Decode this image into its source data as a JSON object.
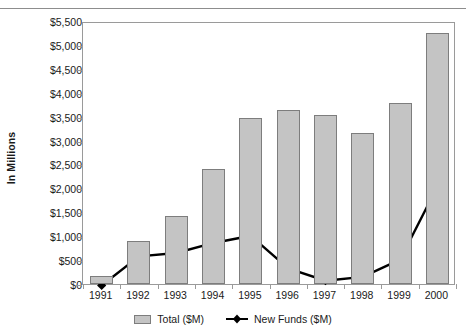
{
  "chart_data": {
    "type": "bar",
    "title": "",
    "xlabel": "",
    "ylabel": "In Millions",
    "ylim": [
      0,
      5500
    ],
    "ytick_step": 500,
    "grid": false,
    "legend_position": "bottom",
    "categories": [
      "1991",
      "1992",
      "1993",
      "1994",
      "1995",
      "1996",
      "1997",
      "1998",
      "1999",
      "2000"
    ],
    "ytick_labels": [
      "$5,500",
      "$5,000",
      "$4,500",
      "$4,000",
      "$3,500",
      "$3,000",
      "$2,500",
      "$2,000",
      "$1,500",
      "$1,000",
      "$500",
      "$0"
    ],
    "ytick_values": [
      5500,
      5000,
      4500,
      4000,
      3500,
      3000,
      2500,
      2000,
      1500,
      1000,
      500,
      0
    ],
    "series": [
      {
        "name": "Total ($M)",
        "kind": "bar",
        "color": "#c4c4c4",
        "border_color": "#7d7d7d",
        "values": [
          175,
          900,
          1420,
          2400,
          3480,
          3640,
          3540,
          3150,
          3790,
          5250
        ]
      },
      {
        "name": "New Funds ($M)",
        "kind": "line",
        "color": "#000000",
        "marker": "diamond",
        "values": [
          10,
          620,
          690,
          900,
          1050,
          370,
          110,
          190,
          550,
          2080
        ]
      }
    ]
  },
  "legend": {
    "items": [
      {
        "label": "Total ($M)",
        "swatch": "bar-swatch-icon"
      },
      {
        "label": "New Funds ($M)",
        "swatch": "line-diamond-icon"
      }
    ]
  }
}
